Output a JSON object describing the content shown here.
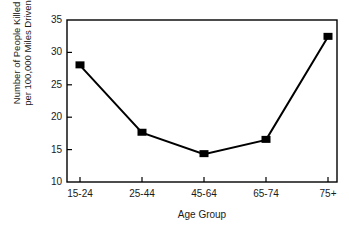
{
  "chart_data": {
    "type": "line",
    "title": "",
    "xlabel": "Age Group",
    "ylabel": "Number of People Killed per 100,000 Miles Driven",
    "ylabel_line1": "Number of People Killed",
    "ylabel_line2": "per 100,000 Miles Driven",
    "categories": [
      "15-24",
      "25-44",
      "45-64",
      "65-74",
      "75+"
    ],
    "values": [
      28.0,
      17.6,
      14.3,
      16.5,
      32.4
    ],
    "yticks": [
      35,
      30,
      25,
      20,
      15,
      10
    ],
    "ylim": [
      10,
      35
    ],
    "grid": false,
    "legend": "none",
    "marker": "square",
    "line_color": "#000000",
    "marker_color": "#000000",
    "axis_color": "#000000",
    "background": "#ffffff"
  },
  "axis": {
    "y_tick_labels": [
      "35",
      "30",
      "25",
      "20",
      "15",
      "10"
    ],
    "x_tick_labels": [
      "15-24",
      "25-44",
      "45-64",
      "65-74",
      "75+"
    ]
  }
}
